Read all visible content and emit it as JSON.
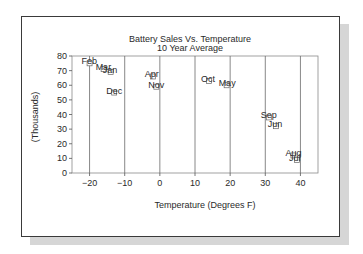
{
  "chart_data": {
    "type": "scatter",
    "title": "Battery Sales Vs. Temperature",
    "subtitle": "10 Year Average",
    "xlabel": "Temperature (Degrees F)",
    "ylabel": "(Thousands)",
    "xlim": [
      -25,
      45
    ],
    "ylim": [
      0,
      80
    ],
    "xticks": [
      -20,
      -10,
      0,
      10,
      20,
      30,
      40
    ],
    "xtick_labels": [
      "−20",
      "−10",
      "0",
      "10",
      "20",
      "30",
      "40"
    ],
    "yticks": [
      0,
      10,
      20,
      30,
      40,
      50,
      60,
      70,
      80
    ],
    "ytick_labels": [
      "0",
      "10",
      "20",
      "30",
      "40",
      "50",
      "60",
      "70",
      "80"
    ],
    "grid": "vertical",
    "legend": "none",
    "points": [
      {
        "label": "Feb",
        "x": -20,
        "y": 75
      },
      {
        "label": "Mar",
        "x": -16,
        "y": 71
      },
      {
        "label": "Jan",
        "x": -14,
        "y": 69
      },
      {
        "label": "Dec",
        "x": -13,
        "y": 55
      },
      {
        "label": "Apr",
        "x": -2,
        "y": 66
      },
      {
        "label": "Nov",
        "x": -1,
        "y": 59
      },
      {
        "label": "Oct",
        "x": 14,
        "y": 63
      },
      {
        "label": "May",
        "x": 19,
        "y": 60
      },
      {
        "label": "Sep",
        "x": 31,
        "y": 38
      },
      {
        "label": "Jun",
        "x": 33,
        "y": 32
      },
      {
        "label": "Aug",
        "x": 38,
        "y": 12
      },
      {
        "label": "Jul",
        "x": 39,
        "y": 9
      }
    ]
  }
}
